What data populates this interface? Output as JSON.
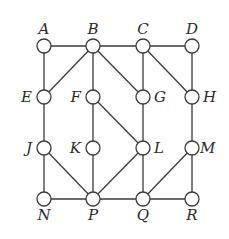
{
  "diagram": {
    "type": "graph",
    "node_radius": 7,
    "colors": {
      "stroke": "#3a3a3a",
      "fill": "#ffffff",
      "label": "#2a2a2a"
    },
    "nodes": [
      {
        "id": "A",
        "label": "A",
        "x": 44,
        "y": 46,
        "lx": 44,
        "ly": 34,
        "anchor": "middle"
      },
      {
        "id": "B",
        "label": "B",
        "x": 93,
        "y": 46,
        "lx": 93,
        "ly": 34,
        "anchor": "middle"
      },
      {
        "id": "C",
        "label": "C",
        "x": 143,
        "y": 46,
        "lx": 143,
        "ly": 34,
        "anchor": "middle"
      },
      {
        "id": "D",
        "label": "D",
        "x": 192,
        "y": 46,
        "lx": 192,
        "ly": 34,
        "anchor": "middle"
      },
      {
        "id": "E",
        "label": "E",
        "x": 44,
        "y": 97,
        "lx": 32,
        "ly": 102,
        "anchor": "end"
      },
      {
        "id": "F",
        "label": "F",
        "x": 93,
        "y": 97,
        "lx": 81,
        "ly": 102,
        "anchor": "end"
      },
      {
        "id": "G",
        "label": "G",
        "x": 143,
        "y": 97,
        "lx": 154,
        "ly": 102,
        "anchor": "start"
      },
      {
        "id": "H",
        "label": "H",
        "x": 192,
        "y": 97,
        "lx": 203,
        "ly": 102,
        "anchor": "start"
      },
      {
        "id": "J",
        "label": "J",
        "x": 44,
        "y": 148,
        "lx": 32,
        "ly": 153,
        "anchor": "end"
      },
      {
        "id": "K",
        "label": "K",
        "x": 93,
        "y": 148,
        "lx": 81,
        "ly": 153,
        "anchor": "end"
      },
      {
        "id": "L",
        "label": "L",
        "x": 143,
        "y": 148,
        "lx": 154,
        "ly": 153,
        "anchor": "start"
      },
      {
        "id": "M",
        "label": "M",
        "x": 192,
        "y": 148,
        "lx": 200,
        "ly": 153,
        "anchor": "start"
      },
      {
        "id": "N",
        "label": "N",
        "x": 44,
        "y": 199,
        "lx": 44,
        "ly": 220,
        "anchor": "middle"
      },
      {
        "id": "P",
        "label": "P",
        "x": 93,
        "y": 199,
        "lx": 93,
        "ly": 220,
        "anchor": "middle"
      },
      {
        "id": "Q",
        "label": "Q",
        "x": 143,
        "y": 199,
        "lx": 143,
        "ly": 220,
        "anchor": "middle"
      },
      {
        "id": "R",
        "label": "R",
        "x": 192,
        "y": 199,
        "lx": 192,
        "ly": 220,
        "anchor": "middle"
      }
    ],
    "edges": [
      [
        "A",
        "B"
      ],
      [
        "B",
        "C"
      ],
      [
        "C",
        "D"
      ],
      [
        "A",
        "E"
      ],
      [
        "B",
        "E"
      ],
      [
        "B",
        "F"
      ],
      [
        "B",
        "G"
      ],
      [
        "C",
        "G"
      ],
      [
        "C",
        "H"
      ],
      [
        "D",
        "H"
      ],
      [
        "E",
        "J"
      ],
      [
        "F",
        "K"
      ],
      [
        "F",
        "L"
      ],
      [
        "G",
        "L"
      ],
      [
        "H",
        "M"
      ],
      [
        "J",
        "N"
      ],
      [
        "J",
        "P"
      ],
      [
        "K",
        "P"
      ],
      [
        "L",
        "P"
      ],
      [
        "L",
        "Q"
      ],
      [
        "M",
        "Q"
      ],
      [
        "M",
        "R"
      ],
      [
        "N",
        "P"
      ],
      [
        "P",
        "Q"
      ],
      [
        "Q",
        "R"
      ]
    ]
  }
}
